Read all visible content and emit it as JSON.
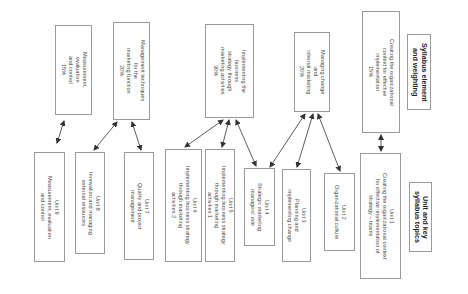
{
  "headers": {
    "syllabus": "Syllabus element\nand weighting",
    "units": "Unit and key\nsyllabus topics"
  },
  "elements": [
    {
      "id": "c15",
      "text": "Creating the organizational\ncontext for effective\nimplementation\n15%"
    },
    {
      "id": "m20",
      "text": "Managing change\nand\ninternal marketing\n20%"
    },
    {
      "id": "i30",
      "text": "Implementing the\nbusiness\nstrategy through\nmarketing activities\n30%"
    },
    {
      "id": "mt20",
      "text": "Management techniques\nfor the\nmarketing function\n20%"
    },
    {
      "id": "me15",
      "text": "Measurement,\nevaluation\nand control\n15%"
    }
  ],
  "units": [
    {
      "id": "u1",
      "text": "Unit 1\nCreating the organizational context\nfor effective implementation of\nstrategy – teams"
    },
    {
      "id": "u2",
      "text": "Unit 2\nOrganizational culture"
    },
    {
      "id": "u3",
      "text": "Unit 3\nPlanning and\nimplementing change"
    },
    {
      "id": "u4",
      "text": "Unit 4\nStrategic marketing\nmanagers' role"
    },
    {
      "id": "u5",
      "text": "Unit 5\nImplementing business strategy\nthrough marketing\nactivities 1"
    },
    {
      "id": "u6",
      "text": "Unit 6\nImplementing business strategy\nthrough marketing\nactivities 2"
    },
    {
      "id": "u7",
      "text": "Unit 7\nQuality and project\nmanagement"
    },
    {
      "id": "u8",
      "text": "Unit 8\nInnovation and managing\nexternal resources"
    },
    {
      "id": "u9",
      "text": "Unit 9\nMeasurement, evaluation\nand control"
    }
  ],
  "connections": [
    [
      "c15",
      "u1"
    ],
    [
      "m20",
      "u4"
    ],
    [
      "m20",
      "u3"
    ],
    [
      "m20",
      "u2"
    ],
    [
      "i30",
      "u6"
    ],
    [
      "i30",
      "u5"
    ],
    [
      "i30",
      "u4"
    ],
    [
      "mt20",
      "u8"
    ],
    [
      "mt20",
      "u7"
    ],
    [
      "me15",
      "u9"
    ]
  ],
  "colors": {
    "border": "#9a9a9a",
    "arrow": "#333333",
    "text": "#4a4a4a"
  }
}
